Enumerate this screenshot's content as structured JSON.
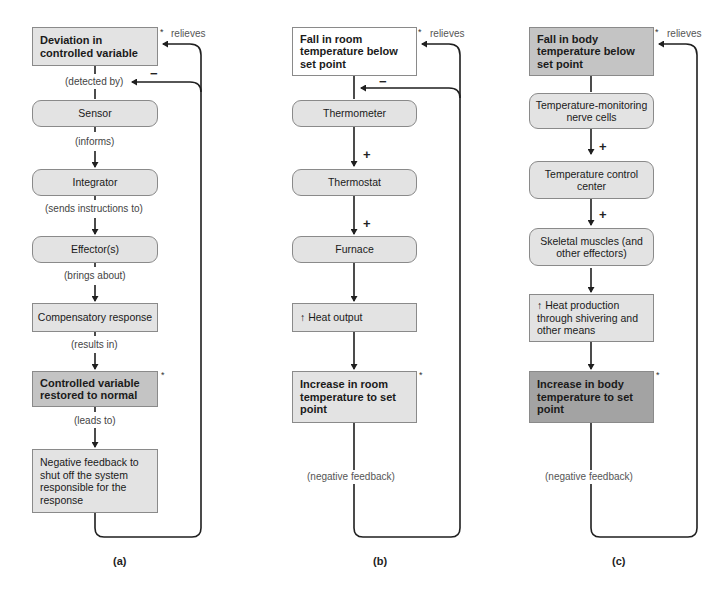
{
  "panels": {
    "a": {
      "caption": "(a)",
      "boxes": [
        {
          "text": "Deviation in controlled variable"
        },
        {
          "text": "Sensor"
        },
        {
          "text": "Integrator"
        },
        {
          "text": "Effector(s)"
        },
        {
          "text": "Compensatory response"
        },
        {
          "text": "Controlled variable restored to normal"
        },
        {
          "text": "Negative feedback to shut off the system responsible for the response"
        }
      ],
      "connectors": [
        "(detected by)",
        "(informs)",
        "(sends instructions to)",
        "(brings about)",
        "(results in)",
        "(leads to)"
      ],
      "relieves": "relieves",
      "minus": "−",
      "star": "*"
    },
    "b": {
      "caption": "(b)",
      "boxes": [
        {
          "text": "Fall in room temperature below set point"
        },
        {
          "text": "Thermometer"
        },
        {
          "text": "Thermostat"
        },
        {
          "text": "Furnace"
        },
        {
          "text": "↑ Heat output"
        },
        {
          "text": "Increase in room temperature to set point"
        }
      ],
      "plus": "+",
      "minus": "−",
      "feedback": "(negative feedback)",
      "relieves": "relieves",
      "star": "*"
    },
    "c": {
      "caption": "(c)",
      "boxes": [
        {
          "text": "Fall in body temperature below set point"
        },
        {
          "text": "Temperature-monitoring nerve cells"
        },
        {
          "text": "Temperature control center"
        },
        {
          "text": "Skeletal muscles (and other effectors)"
        },
        {
          "text": "↑ Heat production through shivering and other means"
        },
        {
          "text": "Increase in body temperature to set point"
        }
      ],
      "plus": "+",
      "feedback": "(negative feedback)",
      "relieves": "relieves",
      "star": "*"
    }
  },
  "colors": {
    "box_white": "#ffffff",
    "box_light": "#e3e3e3",
    "box_mid": "#c4c4c4",
    "box_dark": "#a3a3a3",
    "line": "#1f1f1f"
  }
}
